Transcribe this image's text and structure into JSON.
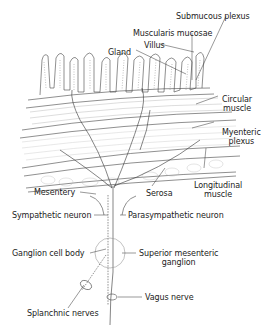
{
  "diagram": {
    "type": "anatomical cross-section",
    "colors": {
      "ink": "#333333",
      "background": "#ffffff",
      "fill": "#f4f4f4"
    },
    "labels": {
      "submucous_plexus": "Submucous plexus",
      "muscularis_mucosae": "Muscularis mucosae",
      "villus": "Villus",
      "gland": "Gland",
      "circular_muscle_1": "Circular",
      "circular_muscle_2": "muscle",
      "myenteric_plexus_1": "Myenteric",
      "myenteric_plexus_2": "plexus",
      "mesentery": "Mesentery",
      "serosa": "Serosa",
      "longitudinal_muscle_1": "Longitudinal",
      "longitudinal_muscle_2": "muscle",
      "sympathetic_neuron": "Sympathetic neuron",
      "parasympathetic_neuron": "Parasympathetic neuron",
      "ganglion_cell_body": "Ganglion cell body",
      "superior_mesenteric_ganglion_1": "Superior mesenteric",
      "superior_mesenteric_ganglion_2": "ganglion",
      "vagus_nerve": "Vagus nerve",
      "splanchnic_nerves": "Splanchnic nerves"
    }
  }
}
